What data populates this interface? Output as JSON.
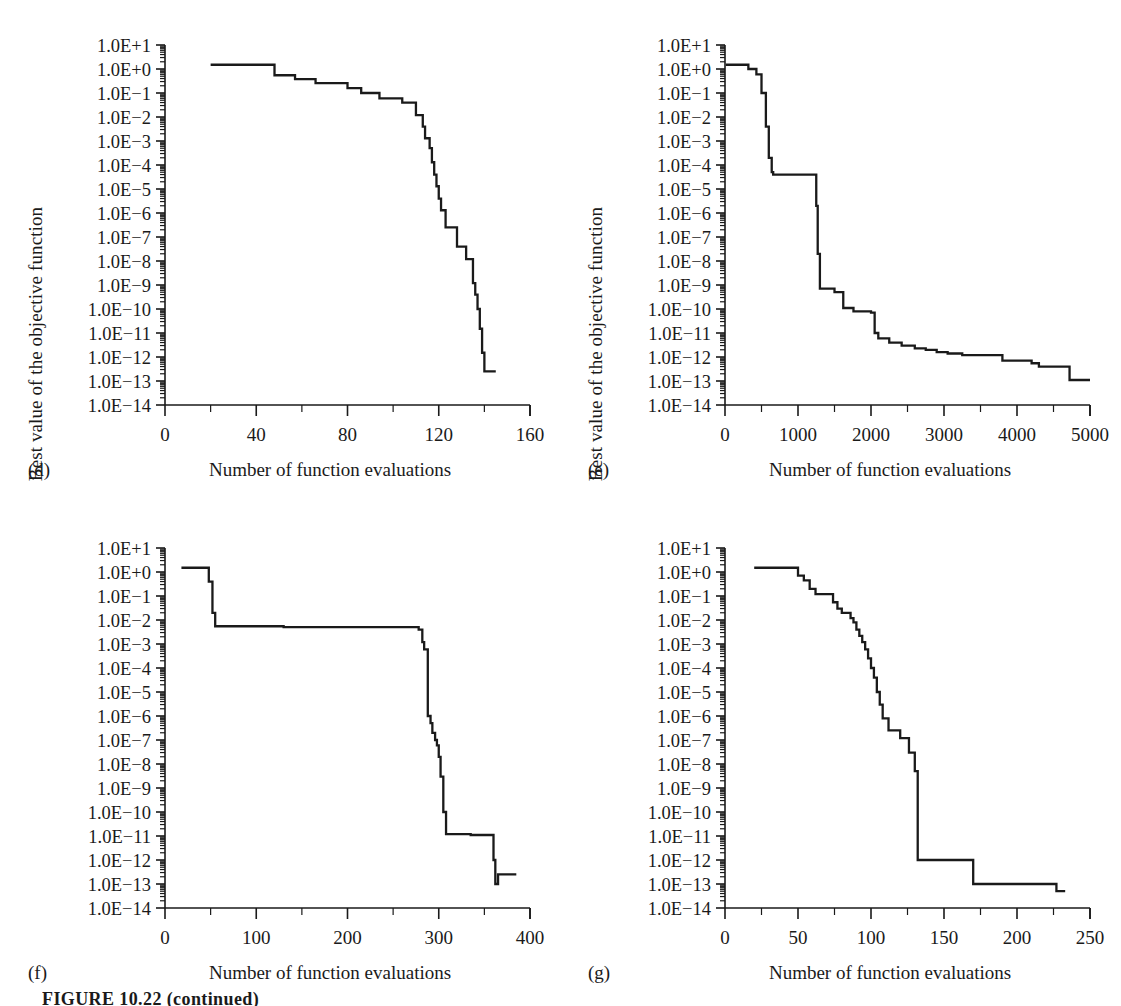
{
  "figure": {
    "caption": "FIGURE 10.22 (continued)",
    "ylabel": "Best value of the objective function",
    "xlabel": "Number of function evaluations",
    "ytick_labels": [
      "1.0E+1",
      "1.0E+0",
      "1.0E−1",
      "1.0E−2",
      "1.0E−3",
      "1.0E−4",
      "1.0E−5",
      "1.0E−6",
      "1.0E−7",
      "1.0E−8",
      "1.0E−9",
      "1.0E−10",
      "1.0E−11",
      "1.0E−12",
      "1.0E−13",
      "1.0E−14"
    ],
    "line_color": "#1a1a1a",
    "background_color": "#ffffff"
  },
  "panels": [
    {
      "id": "d",
      "letter": "(d)"
    },
    {
      "id": "e",
      "letter": "(e)"
    },
    {
      "id": "f",
      "letter": "(f)"
    },
    {
      "id": "g",
      "letter": "(g)"
    }
  ],
  "chart_data": [
    {
      "panel": "(d)",
      "type": "line",
      "title": "",
      "xlabel": "Number of function evaluations",
      "ylabel": "Best value of the objective function",
      "yscale": "log",
      "ylim": [
        1e-14,
        10
      ],
      "xlim": [
        0,
        160
      ],
      "xticks": [
        0,
        40,
        80,
        120,
        160
      ],
      "xminor_step": 20,
      "yticks": [
        10,
        1,
        0.1,
        0.01,
        0.001,
        0.0001,
        1e-05,
        1e-06,
        1e-07,
        1e-08,
        1e-09,
        1e-10,
        1e-11,
        1e-12,
        1e-13,
        1e-14
      ],
      "ytick_labels": [
        "1.0E+1",
        "1.0E+0",
        "1.0E−1",
        "1.0E−2",
        "1.0E−3",
        "1.0E−4",
        "1.0E−5",
        "1.0E−6",
        "1.0E−7",
        "1.0E−8",
        "1.0E−9",
        "1.0E−10",
        "1.0E−11",
        "1.0E−12",
        "1.0E−13",
        "1.0E−14"
      ],
      "grid": false,
      "legend": "none",
      "x": [
        20,
        47,
        48,
        52,
        57,
        60,
        66,
        72,
        80,
        84,
        86,
        90,
        94,
        98,
        104,
        108,
        110,
        112,
        113,
        114,
        116,
        117,
        118,
        119,
        120,
        121,
        123,
        126,
        128,
        130,
        132,
        133,
        135,
        136,
        137,
        138,
        139,
        140,
        145
      ],
      "y": [
        1.5,
        1.5,
        0.55,
        0.55,
        0.38,
        0.38,
        0.26,
        0.26,
        0.16,
        0.16,
        0.1,
        0.1,
        0.06,
        0.06,
        0.04,
        0.04,
        0.012,
        0.012,
        0.004,
        0.0013,
        0.0005,
        0.00013,
        4e-05,
        1.3e-05,
        4e-06,
        1.3e-06,
        2.5e-07,
        2.5e-07,
        4e-08,
        4e-08,
        1.2e-08,
        1.2e-08,
        1.2e-09,
        4e-10,
        1e-10,
        1.5e-11,
        1.5e-12,
        2.5e-13,
        2.5e-13
      ]
    },
    {
      "panel": "(e)",
      "type": "line",
      "title": "",
      "xlabel": "Number of function evaluations",
      "ylabel": "Best value of the objective function",
      "yscale": "log",
      "ylim": [
        1e-14,
        10
      ],
      "xlim": [
        0,
        5000
      ],
      "xticks": [
        0,
        1000,
        2000,
        3000,
        4000,
        5000
      ],
      "xminor_step": 500,
      "yticks": [
        10,
        1,
        0.1,
        0.01,
        0.001,
        0.0001,
        1e-05,
        1e-06,
        1e-07,
        1e-08,
        1e-09,
        1e-10,
        1e-11,
        1e-12,
        1e-13,
        1e-14
      ],
      "ytick_labels": [
        "1.0E+1",
        "1.0E+0",
        "1.0E−1",
        "1.0E−2",
        "1.0E−3",
        "1.0E−4",
        "1.0E−5",
        "1.0E−6",
        "1.0E−7",
        "1.0E−8",
        "1.0E−9",
        "1.0E−10",
        "1.0E−11",
        "1.0E−12",
        "1.0E−13",
        "1.0E−14"
      ],
      "grid": false,
      "legend": "none",
      "x": [
        10,
        300,
        320,
        400,
        430,
        500,
        560,
        600,
        640,
        660,
        1230,
        1250,
        1270,
        1300,
        1450,
        1500,
        1560,
        1620,
        1700,
        1760,
        1900,
        2000,
        2050,
        2100,
        2180,
        2250,
        2320,
        2420,
        2500,
        2600,
        2750,
        2900,
        3050,
        3250,
        3500,
        3800,
        3900,
        4200,
        4300,
        4650,
        4720,
        5000
      ],
      "y": [
        1.5,
        1.5,
        1.0,
        1.0,
        0.6,
        0.1,
        0.004,
        0.0002,
        5e-05,
        4e-05,
        4e-05,
        2e-06,
        2e-08,
        7e-10,
        7e-10,
        5e-10,
        5e-10,
        1.1e-10,
        1.1e-10,
        8e-11,
        8e-11,
        7e-11,
        1e-11,
        6e-12,
        6e-12,
        4e-12,
        4e-12,
        3e-12,
        3e-12,
        2.3e-12,
        2e-12,
        1.6e-12,
        1.4e-12,
        1.2e-12,
        1.2e-12,
        7e-13,
        7e-13,
        5.5e-13,
        4e-13,
        4e-13,
        1.1e-13,
        1.1e-13
      ]
    },
    {
      "panel": "(f)",
      "type": "line",
      "title": "",
      "xlabel": "Number of function evaluations",
      "ylabel": "Best value of the objective function",
      "yscale": "log",
      "ylim": [
        1e-14,
        10
      ],
      "xlim": [
        0,
        400
      ],
      "xticks": [
        0,
        100,
        200,
        300,
        400
      ],
      "xminor_step": 50,
      "yticks": [
        10,
        1,
        0.1,
        0.01,
        0.001,
        0.0001,
        1e-05,
        1e-06,
        1e-07,
        1e-08,
        1e-09,
        1e-10,
        1e-11,
        1e-12,
        1e-13,
        1e-14
      ],
      "ytick_labels": [
        "1.0E+1",
        "1.0E+0",
        "1.0E−1",
        "1.0E−2",
        "1.0E−3",
        "1.0E−4",
        "1.0E−5",
        "1.0E−6",
        "1.0E−7",
        "1.0E−8",
        "1.0E−9",
        "1.0E−10",
        "1.0E−11",
        "1.0E−12",
        "1.0E−13",
        "1.0E−14"
      ],
      "grid": false,
      "legend": "none",
      "x": [
        18,
        45,
        48,
        52,
        55,
        125,
        130,
        272,
        278,
        282,
        284,
        288,
        291,
        293,
        296,
        298,
        300,
        302,
        305,
        308,
        330,
        335,
        358,
        360,
        362,
        365,
        385
      ],
      "y": [
        1.5,
        1.5,
        0.4,
        0.02,
        0.0055,
        0.0055,
        0.005,
        0.005,
        0.004,
        0.0012,
        0.0006,
        1e-06,
        5e-07,
        2e-07,
        1e-07,
        6e-08,
        2e-08,
        3e-09,
        1e-10,
        1.2e-11,
        1.2e-11,
        1.1e-11,
        1.1e-11,
        1e-12,
        1e-13,
        2.5e-13,
        2.5e-13
      ]
    },
    {
      "panel": "(g)",
      "type": "line",
      "title": "",
      "xlabel": "Number of function evaluations",
      "ylabel": "Best value of the objective function",
      "yscale": "log",
      "ylim": [
        1e-14,
        10
      ],
      "xlim": [
        0,
        250
      ],
      "xticks": [
        0,
        50,
        100,
        150,
        200,
        250
      ],
      "xminor_step": 25,
      "yticks": [
        10,
        1,
        0.1,
        0.01,
        0.001,
        0.0001,
        1e-05,
        1e-06,
        1e-07,
        1e-08,
        1e-09,
        1e-10,
        1e-11,
        1e-12,
        1e-13,
        1e-14
      ],
      "ytick_labels": [
        "1.0E+1",
        "1.0E+0",
        "1.0E−1",
        "1.0E−2",
        "1.0E−3",
        "1.0E−4",
        "1.0E−5",
        "1.0E−6",
        "1.0E−7",
        "1.0E−8",
        "1.0E−9",
        "1.0E−10",
        "1.0E−11",
        "1.0E−12",
        "1.0E−13",
        "1.0E−14"
      ],
      "grid": false,
      "legend": "none",
      "x": [
        20,
        47,
        50,
        54,
        58,
        62,
        66,
        74,
        77,
        80,
        83,
        86,
        88,
        90,
        92,
        94,
        96,
        98,
        100,
        102,
        104,
        106,
        108,
        112,
        118,
        120,
        123,
        126,
        128,
        130,
        132,
        133,
        168,
        170,
        225,
        227,
        233
      ],
      "y": [
        1.5,
        1.5,
        0.7,
        0.45,
        0.2,
        0.12,
        0.12,
        0.055,
        0.03,
        0.02,
        0.02,
        0.012,
        0.008,
        0.004,
        0.0022,
        0.0012,
        0.0006,
        0.00025,
        0.0001,
        4e-05,
        1e-05,
        3e-06,
        8e-07,
        2.5e-07,
        2.5e-07,
        1.2e-07,
        1.2e-07,
        3e-08,
        3e-08,
        5e-09,
        1e-12,
        1e-12,
        1e-12,
        1e-13,
        1e-13,
        5e-14,
        5e-14
      ]
    }
  ]
}
